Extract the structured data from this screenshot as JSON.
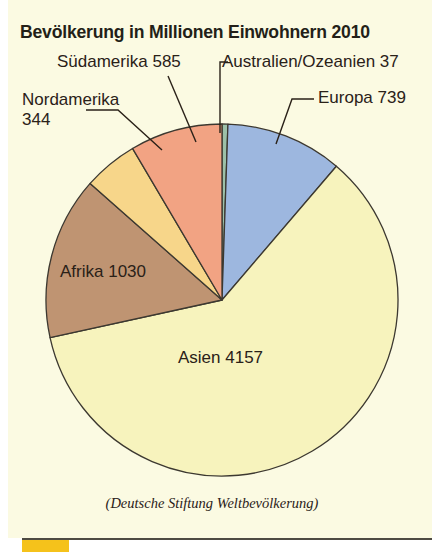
{
  "panel": {
    "background_color": "#fbfae2"
  },
  "header": {
    "title": "Bevölkerung in Millionen Einwohnern 2010"
  },
  "footer": {
    "source": "(Deutsche Stiftung Weltbevölkerung)",
    "rule_color": "#4d4a42",
    "accent_bar_color": "#f5c21b"
  },
  "callouts": {
    "suedamerika": "Südamerika 585",
    "australien": "Australien/Ozeanien 37",
    "nordamerika": "Nordamerika\n344",
    "europa": "Europa 739"
  },
  "slice_labels": {
    "afrika": "Afrika 1030",
    "asien": "Asien 4157"
  },
  "chart_data": {
    "type": "pie",
    "title": "Bevölkerung in Millionen Einwohnern 2010",
    "subtitle": "",
    "unit": "Millionen Einwohner",
    "year": 2010,
    "source": "(Deutsche Stiftung Weltbevölkerung)",
    "total": 6892,
    "center": [
      222,
      300
    ],
    "radius": 176,
    "start_angle_deg": 0,
    "direction": "clockwise",
    "grid": false,
    "legend": "none",
    "labels_position": "callouts-and-inside",
    "categories": [
      "Australien/Ozeanien",
      "Europa",
      "Asien",
      "Afrika",
      "Nordamerika",
      "Südamerika"
    ],
    "values": [
      37,
      739,
      4157,
      1030,
      344,
      585
    ],
    "colors": [
      "#9cc0a8",
      "#9db7df",
      "#f7f3bd",
      "#bf9472",
      "#f7d68a",
      "#f2a383"
    ],
    "slices": [
      {
        "label": "Australien/Ozeanien",
        "value": 37,
        "percent": 0.5,
        "color": "#9cc0a8",
        "label_text": "Australien/Ozeanien 37"
      },
      {
        "label": "Europa",
        "value": 739,
        "percent": 10.7,
        "color": "#9db7df",
        "label_text": "Europa 739"
      },
      {
        "label": "Asien",
        "value": 4157,
        "percent": 60.3,
        "color": "#f7f3bd",
        "label_text": "Asien 4157"
      },
      {
        "label": "Afrika",
        "value": 1030,
        "percent": 14.9,
        "color": "#bf9472",
        "label_text": "Afrika 1030"
      },
      {
        "label": "Nordamerika",
        "value": 344,
        "percent": 5.0,
        "color": "#f7d68a",
        "label_text": "Nordamerika 344"
      },
      {
        "label": "Südamerika",
        "value": 585,
        "percent": 8.5,
        "color": "#f2a383",
        "label_text": "Südamerika 585"
      }
    ]
  }
}
